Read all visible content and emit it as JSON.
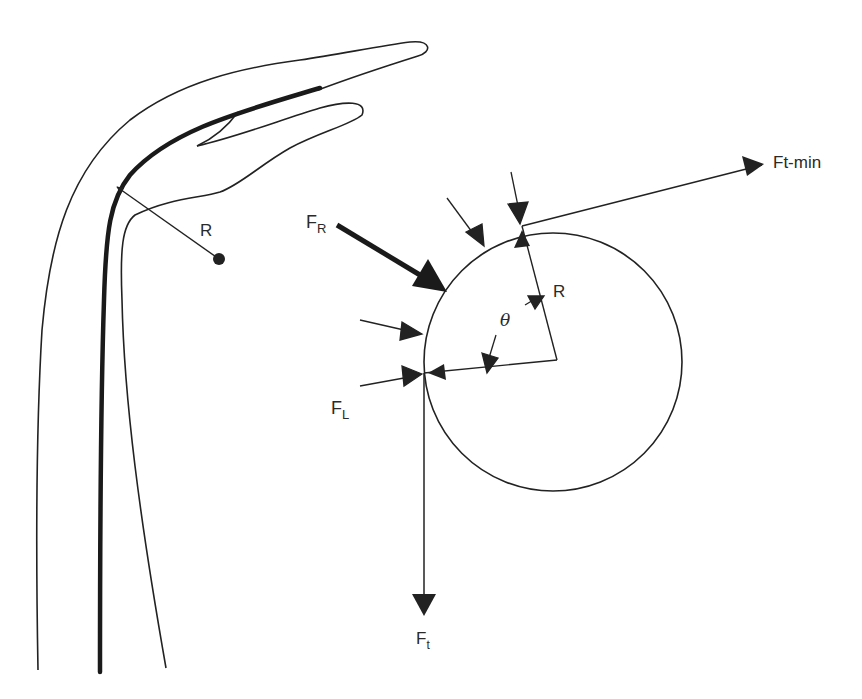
{
  "figure": {
    "colors": {
      "ink": "#222222",
      "background": "#ffffff"
    }
  },
  "finger": {
    "radius_label": "R"
  },
  "pulley": {
    "radius_label": "R",
    "angle_label": "θ"
  },
  "forces": {
    "resultant": {
      "label_main": "F",
      "label_sub": "R"
    },
    "friction": {
      "label_main": "F",
      "label_sub": "L"
    },
    "tension": {
      "label_main": "F",
      "label_sub": "t"
    },
    "tension_min": {
      "label": "Ft-min"
    }
  }
}
